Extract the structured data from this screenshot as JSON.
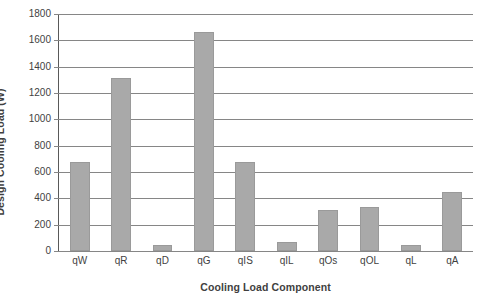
{
  "chart_data": {
    "type": "bar",
    "title": "",
    "xlabel": "Cooling Load Component",
    "ylabel": "Design Cooling Load (W)",
    "categories": [
      "qW",
      "qR",
      "qD",
      "qG",
      "qIS",
      "qIL",
      "qOs",
      "qOL",
      "qL",
      "qA"
    ],
    "values": [
      676,
      1314,
      46,
      1660,
      676,
      68,
      311,
      334,
      46,
      448
    ],
    "ylim": [
      0,
      1800
    ],
    "ytick_step": 200,
    "ytick_labels": [
      "1800",
      "1600",
      "1400",
      "1200",
      "1000",
      "800",
      "600",
      "400",
      "200",
      "0"
    ],
    "ytick_values": [
      1800,
      1600,
      1400,
      1200,
      1000,
      800,
      600,
      400,
      200,
      0
    ],
    "grid": "horizontal",
    "legend": "none",
    "bar_color": "#a9a9a9",
    "bar_border_color": "#9a9a9a",
    "gridline_color": "#868686",
    "axis_color": "#595959",
    "text_color": "#3f3f3f",
    "background_color": "#ffffff"
  }
}
